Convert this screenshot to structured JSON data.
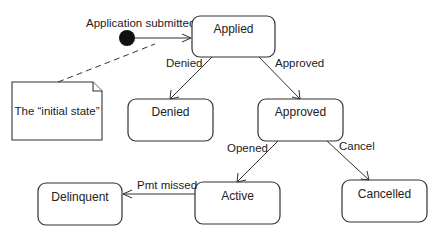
{
  "diagram": {
    "type": "state-machine",
    "initial_state_label": "Application submitted",
    "note": {
      "text": "The “initial state”"
    },
    "states": [
      {
        "id": "applied",
        "label": "Applied"
      },
      {
        "id": "denied",
        "label": "Denied"
      },
      {
        "id": "approved",
        "label": "Approved"
      },
      {
        "id": "active",
        "label": "Active"
      },
      {
        "id": "cancelled",
        "label": "Cancelled"
      },
      {
        "id": "delinquent",
        "label": "Delinquent"
      }
    ],
    "transitions": [
      {
        "from": "initial",
        "to": "applied",
        "label": ""
      },
      {
        "from": "applied",
        "to": "denied",
        "label": "Denied"
      },
      {
        "from": "applied",
        "to": "approved",
        "label": "Approved"
      },
      {
        "from": "approved",
        "to": "active",
        "label": "Opened"
      },
      {
        "from": "approved",
        "to": "cancelled",
        "label": "Cancel"
      },
      {
        "from": "active",
        "to": "delinquent",
        "label": "Pmt missed"
      }
    ],
    "colors": {
      "stroke": "#333333",
      "text": "#222222",
      "background": "#ffffff",
      "initial_node": "#111111"
    }
  }
}
